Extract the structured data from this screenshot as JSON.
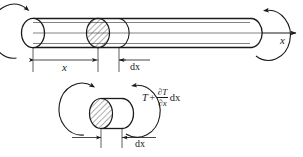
{
  "figure": {
    "stroke_color": "#1a1a1a",
    "hatch_color": "#1a1a1a",
    "background": "#ffffff",
    "top_view": {
      "axis_label": "x",
      "dimension_x_label": "x",
      "dimension_dx_label": "dx",
      "rotation_arrow_left": "curved-arrow-ccw",
      "rotation_arrow_right": "curved-arrow-ccw",
      "axis_arrow": "arrow-right"
    },
    "bottom_view": {
      "dimension_dx_label": "dx",
      "torque_symbol": "T",
      "torque_plus": "+",
      "torque_numerator": "∂T",
      "torque_denominator": "∂x",
      "torque_differential": "dx",
      "torque_full": "T + ∂T/∂x dx",
      "rotation_arrow_left": "curved-arrow-ccw",
      "rotation_arrow_right": "curved-arrow-ccw"
    }
  }
}
